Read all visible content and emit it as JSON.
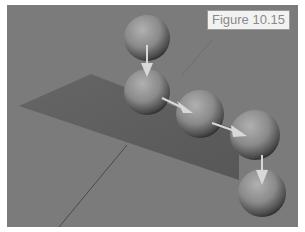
{
  "figure": {
    "label": "Figure 10.15",
    "colors": {
      "background": "#7b7b7b",
      "plane": "#5f5f5f",
      "sphere": "#8a8a8a",
      "arrow": "#d8d8d8",
      "label_bg": "#f2f2f2",
      "label_text": "#8a8a8a"
    },
    "spheres": [
      {
        "id": 1,
        "cx": 140,
        "cy": 33,
        "r": 23
      },
      {
        "id": 2,
        "cx": 140,
        "cy": 87,
        "r": 23
      },
      {
        "id": 3,
        "cx": 193,
        "cy": 109,
        "r": 24
      },
      {
        "id": 4,
        "cx": 248,
        "cy": 130,
        "r": 25
      },
      {
        "id": 5,
        "cx": 255,
        "cy": 188,
        "r": 24
      }
    ],
    "arrows": [
      {
        "from": [
          140,
          40
        ],
        "to": [
          140,
          75
        ]
      },
      {
        "from": [
          155,
          93
        ],
        "to": [
          185,
          108
        ]
      },
      {
        "from": [
          205,
          118
        ],
        "to": [
          240,
          130
        ]
      },
      {
        "from": [
          255,
          150
        ],
        "to": [
          255,
          180
        ]
      }
    ]
  }
}
